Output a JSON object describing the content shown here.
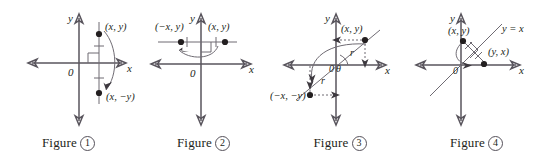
{
  "diagram": {
    "axis_color": "#58545c",
    "line_color": "#6f6b73",
    "point_color": "#231f20",
    "text_color": "#231f20",
    "figures": [
      {
        "id": "figure-1",
        "caption_word": "Figure",
        "caption_number": "1",
        "axis_x_label": "x",
        "axis_y_label": "y",
        "origin_label": "0",
        "point_labels": [
          "(x, y)",
          "(x, −y)"
        ],
        "marks": [
          "right-angle",
          "tick",
          "tick",
          "arrow-arc"
        ],
        "meaning": "reflection across the x-axis"
      },
      {
        "id": "figure-2",
        "caption_word": "Figure",
        "caption_number": "2",
        "axis_x_label": "x",
        "axis_y_label": "y",
        "origin_label": "0",
        "point_labels": [
          "(−x, y)",
          "(x, y)"
        ],
        "marks": [
          "right-angle",
          "tick",
          "tick",
          "arrow-arc"
        ],
        "meaning": "reflection across the y-axis"
      },
      {
        "id": "figure-3",
        "caption_word": "Figure",
        "caption_number": "3",
        "axis_x_label": "x",
        "axis_y_label": "y",
        "origin_label": "0",
        "angle_label": "θ",
        "radius_labels": [
          "r",
          "r"
        ],
        "point_labels": [
          "(x, y)",
          "(−x, −y)"
        ],
        "marks": [
          "dashed-leader",
          "dashed-leader",
          "arrow-arc"
        ],
        "meaning": "rotation of 180° about the origin"
      },
      {
        "id": "figure-4",
        "caption_word": "Figure",
        "caption_number": "4",
        "axis_x_label": "x",
        "axis_y_label": "y",
        "origin_label": "0",
        "line_label": "y = x",
        "point_labels": [
          "(x, y)",
          "(y, x)"
        ],
        "marks": [
          "right-angle",
          "tick",
          "tick",
          "arrow-arc"
        ],
        "meaning": "reflection across the line y = x"
      }
    ]
  }
}
